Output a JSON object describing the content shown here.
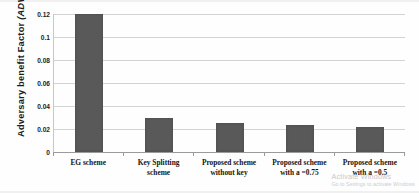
{
  "chart_data": {
    "type": "bar",
    "title": "",
    "xlabel": "",
    "ylabel": "Adversary benefit Factor (ADV)",
    "ylabel_plain": "Adversary benefit Factor",
    "ylabel_italic": "(ADV)",
    "categories": [
      "EG scheme",
      "Key Splitting scheme",
      "Proposed scheme without key",
      "Proposed scheme with a =0.75",
      "Proposed scheme with a =0.5"
    ],
    "category_lines": [
      [
        "EG scheme",
        ""
      ],
      [
        "Key Splitting",
        "scheme"
      ],
      [
        "Proposed scheme",
        "without key"
      ],
      [
        "Proposed scheme",
        "with a =0.75"
      ],
      [
        "Proposed scheme",
        "with a =0.5"
      ]
    ],
    "values": [
      0.12,
      0.0295,
      0.0255,
      0.0235,
      0.0215
    ],
    "ylim": [
      0,
      0.12
    ],
    "yticks": [
      0,
      0.02,
      0.04,
      0.06,
      0.08,
      0.1,
      0.12
    ],
    "ytick_labels": [
      "0",
      "0.02",
      "0.04",
      "0.06",
      "0.08",
      "0.1",
      "0.12"
    ],
    "grid": true,
    "grid_axis": "y",
    "legend": false,
    "bar_color": "#595959",
    "gridline_color": "#d3d3d3"
  },
  "watermark": {
    "line1": "Activate Windows",
    "line2": "Go to Settings to activate Windows"
  }
}
